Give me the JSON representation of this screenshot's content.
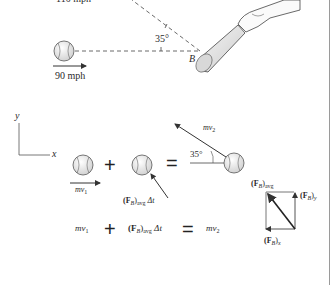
{
  "top_scene": {
    "speed_out_label": "110 mph",
    "speed_in_label": "90 mph",
    "angle_label": "35°",
    "point_label": "B"
  },
  "coords": {
    "x_label": "x",
    "y_label": "y"
  },
  "impulse_diagram": {
    "mv1_label": "mv",
    "mv1_sub": "1",
    "impulse_label": "(F",
    "impulse_sub_B": "B",
    "impulse_avg": "avg",
    "impulse_dt": "Δt",
    "mv2_label": "mv",
    "mv2_sub": "2",
    "angle_label": "35°",
    "plus": "+",
    "equals": "="
  },
  "equation": {
    "term1": "mv",
    "term1_sub": "1",
    "plus": "+",
    "term2_open": "(F",
    "term2_B": "B",
    "term2_avg": "avg",
    "term2_dt": "Δt",
    "equals": "=",
    "term3": "mv",
    "term3_sub": "2"
  },
  "force_components": {
    "avg_label": "(F",
    "avg_B": "B",
    "avg_sub": "avg",
    "y_label": "(F",
    "y_B": "B",
    "y_sub": "y",
    "x_label": "(F",
    "x_B": "B",
    "x_sub": "x"
  },
  "colors": {
    "ink": "#222222",
    "ball_fill": "#e8e8e8",
    "bat_fill": "#e0e0e0",
    "rule": "#9a9a9a"
  }
}
